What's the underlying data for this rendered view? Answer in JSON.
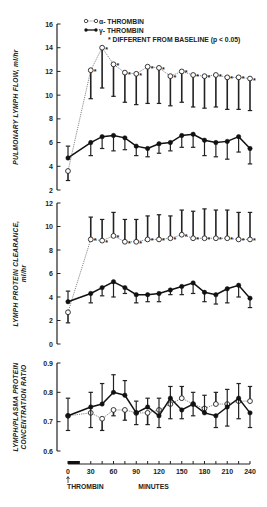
{
  "legend": {
    "alpha_label": "α- THROMBIN",
    "gamma_label": "γ- THROMBIN",
    "star_label": "* DIFFERENT FROM BASELINE (p < 0.05)"
  },
  "x_axis": {
    "title": "MINUTES",
    "marker_label": "THROMBIN",
    "ticks": [
      "0",
      "30",
      "60",
      "90",
      "120",
      "150",
      "180",
      "210",
      "240"
    ]
  },
  "panels": [
    {
      "ylabel": "PULMONARY LYMPH FLOW, ml/hr",
      "ticks": [
        "16",
        "14",
        "12",
        "10",
        "8",
        "6",
        "4",
        "2"
      ]
    },
    {
      "ylabel_line1": "LYMPH PROTEIN CLEARANCE,",
      "ylabel_line2": "ml/hr",
      "ticks": [
        "12",
        "10",
        "8",
        "6",
        "4",
        "2",
        "0"
      ]
    },
    {
      "ylabel_line1": "LYMPH/PLASMA PROTEIN",
      "ylabel_line2": "CONCENTRATION RATIO",
      "ticks": [
        "0.9",
        "0.8",
        "0.7",
        "0.6"
      ]
    }
  ],
  "chart_data": [
    {
      "type": "line",
      "title": "Pulmonary lymph flow",
      "xlabel": "MINUTES",
      "ylabel": "PULMONARY LYMPH FLOW, ml/hr",
      "ylim": [
        2,
        16
      ],
      "x": [
        0,
        30,
        45,
        60,
        75,
        90,
        105,
        120,
        135,
        150,
        165,
        180,
        195,
        210,
        225,
        240
      ],
      "series": [
        {
          "name": "α-THROMBIN",
          "marker": "open-circle",
          "values": [
            3.6,
            12.1,
            14.0,
            12.6,
            11.9,
            11.8,
            12.4,
            12.3,
            11.6,
            12.0,
            11.7,
            11.6,
            11.7,
            11.5,
            11.5,
            11.4
          ],
          "err_lower": [
            2.8,
            9.7,
            10.6,
            9.9,
            9.4,
            9.2,
            9.3,
            9.3,
            9.1,
            9.4,
            9.0,
            8.9,
            9.0,
            8.8,
            8.8,
            8.7
          ],
          "significant": [
            false,
            true,
            true,
            true,
            true,
            true,
            true,
            true,
            true,
            true,
            true,
            true,
            true,
            true,
            true,
            true
          ]
        },
        {
          "name": "γ-THROMBIN",
          "marker": "filled-circle",
          "values": [
            4.7,
            6.0,
            6.5,
            6.6,
            6.4,
            5.7,
            5.5,
            5.9,
            6.0,
            6.6,
            6.7,
            6.2,
            6.0,
            6.1,
            6.5,
            5.5
          ],
          "err_upper": [
            5.7,
            null,
            null,
            null,
            null,
            null,
            null,
            null,
            null,
            null,
            null,
            null,
            null,
            null,
            null,
            null
          ],
          "err_lower": [
            null,
            4.9,
            5.5,
            5.3,
            5.4,
            4.9,
            4.8,
            5.1,
            5.3,
            5.6,
            5.6,
            4.9,
            4.8,
            4.6,
            5.2,
            4.2
          ]
        }
      ]
    },
    {
      "type": "line",
      "title": "Lymph protein clearance",
      "xlabel": "MINUTES",
      "ylabel": "LYMPH PROTEIN CLEARANCE, ml/hr",
      "ylim": [
        0,
        12
      ],
      "x": [
        0,
        30,
        45,
        60,
        75,
        90,
        105,
        120,
        135,
        150,
        165,
        180,
        195,
        210,
        225,
        240
      ],
      "series": [
        {
          "name": "α-THROMBIN",
          "marker": "open-circle",
          "values": [
            2.7,
            8.9,
            8.8,
            9.2,
            8.7,
            8.7,
            8.9,
            8.9,
            9.0,
            9.3,
            9.0,
            9.0,
            9.0,
            9.0,
            8.9,
            8.9
          ],
          "err_upper": [
            null,
            10.8,
            10.6,
            11.2,
            10.6,
            10.6,
            10.9,
            11.0,
            10.9,
            11.4,
            11.3,
            11.5,
            11.4,
            11.4,
            11.2,
            11.2
          ],
          "err_lower": [
            1.8,
            null,
            null,
            null,
            null,
            null,
            null,
            null,
            null,
            null,
            null,
            null,
            null,
            null,
            null,
            null
          ],
          "significant": [
            false,
            true,
            true,
            true,
            true,
            true,
            true,
            true,
            true,
            true,
            true,
            true,
            true,
            true,
            true,
            true
          ]
        },
        {
          "name": "γ-THROMBIN",
          "marker": "filled-circle",
          "values": [
            3.6,
            4.3,
            4.8,
            5.3,
            4.8,
            4.2,
            4.2,
            4.3,
            4.6,
            4.9,
            5.2,
            4.4,
            4.2,
            4.7,
            5.0,
            3.9
          ],
          "err_upper": [
            4.5,
            null,
            null,
            null,
            null,
            null,
            null,
            null,
            null,
            null,
            null,
            null,
            null,
            null,
            null,
            null
          ],
          "err_lower": [
            null,
            3.5,
            4.1,
            4.0,
            4.3,
            3.5,
            3.6,
            3.6,
            4.2,
            4.2,
            4.3,
            3.6,
            3.4,
            3.5,
            4.0,
            3.1
          ]
        }
      ]
    },
    {
      "type": "line",
      "title": "Lymph/plasma protein concentration ratio",
      "xlabel": "MINUTES",
      "ylabel": "LYMPH/PLASMA PROTEIN CONCENTRATION RATIO",
      "ylim": [
        0.6,
        0.9
      ],
      "x": [
        0,
        30,
        45,
        60,
        75,
        90,
        105,
        120,
        135,
        150,
        165,
        180,
        195,
        210,
        225,
        240
      ],
      "series": [
        {
          "name": "α-THROMBIN",
          "marker": "open-circle",
          "values": [
            0.72,
            0.73,
            0.71,
            0.74,
            0.74,
            0.73,
            0.73,
            0.74,
            0.76,
            0.78,
            0.76,
            0.745,
            0.76,
            0.76,
            0.77,
            0.77
          ],
          "err_upper": [
            null,
            null,
            null,
            null,
            null,
            null,
            null,
            null,
            null,
            0.82,
            null,
            null,
            0.8,
            null,
            null,
            0.82
          ],
          "err_lower": [
            null,
            null,
            0.67,
            0.72,
            0.705,
            null,
            0.69,
            null,
            null,
            null,
            null,
            0.73,
            null,
            null,
            null,
            null
          ]
        },
        {
          "name": "γ-THROMBIN",
          "marker": "filled-circle",
          "values": [
            0.72,
            0.75,
            0.76,
            0.8,
            0.79,
            0.73,
            0.75,
            0.72,
            0.78,
            0.74,
            0.76,
            0.73,
            0.72,
            0.75,
            0.78,
            0.73
          ],
          "err_upper": [
            0.78,
            0.8,
            0.83,
            0.86,
            0.84,
            0.77,
            0.78,
            0.78,
            0.82,
            null,
            0.8,
            0.79,
            null,
            0.81,
            0.83,
            null
          ],
          "err_lower": [
            0.67,
            0.68,
            null,
            null,
            null,
            0.69,
            null,
            0.68,
            0.71,
            0.71,
            0.72,
            null,
            0.68,
            0.685,
            0.71,
            0.68
          ]
        }
      ]
    }
  ]
}
